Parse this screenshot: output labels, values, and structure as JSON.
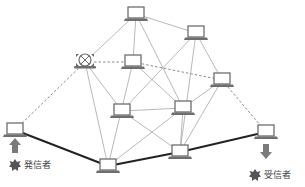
{
  "diagram": {
    "title": "",
    "colors": {
      "thin_line": "#9a9a9a",
      "dashed_line": "#8a8a8a",
      "bold_line": "#222222",
      "laptop_fill": "#6e6e6e",
      "arrow_fill": "#7a7a7a",
      "badge_fill": "#555555"
    },
    "nodes": [
      {
        "id": "n1",
        "x": 136,
        "y": 14,
        "type": "laptop"
      },
      {
        "id": "n2",
        "x": 196,
        "y": 33,
        "type": "laptop"
      },
      {
        "id": "n3",
        "x": 85,
        "y": 62,
        "type": "broken-laptop"
      },
      {
        "id": "n4",
        "x": 133,
        "y": 62,
        "type": "laptop"
      },
      {
        "id": "n5",
        "x": 222,
        "y": 80,
        "type": "laptop"
      },
      {
        "id": "n6",
        "x": 122,
        "y": 111,
        "type": "laptop"
      },
      {
        "id": "n7",
        "x": 183,
        "y": 108,
        "type": "laptop"
      },
      {
        "id": "n8",
        "x": 180,
        "y": 152,
        "type": "laptop"
      },
      {
        "id": "n9",
        "x": 108,
        "y": 166,
        "type": "laptop"
      },
      {
        "id": "sender",
        "x": 15,
        "y": 130,
        "type": "laptop"
      },
      {
        "id": "receiver",
        "x": 266,
        "y": 132,
        "type": "laptop"
      }
    ],
    "edges_thin": [
      [
        "n1",
        "n3"
      ],
      [
        "n1",
        "n2"
      ],
      [
        "n1",
        "n4"
      ],
      [
        "n1",
        "n7"
      ],
      [
        "n2",
        "n6"
      ],
      [
        "n2",
        "n8"
      ],
      [
        "n2",
        "n5"
      ],
      [
        "n3",
        "n6"
      ],
      [
        "n3",
        "n9"
      ],
      [
        "n4",
        "n9"
      ],
      [
        "n4",
        "n7"
      ],
      [
        "n5",
        "n7"
      ],
      [
        "n5",
        "n8"
      ],
      [
        "n6",
        "n7"
      ],
      [
        "n6",
        "n8"
      ],
      [
        "n7",
        "n9"
      ],
      [
        "n7",
        "n8"
      ]
    ],
    "edges_dashed": [
      [
        "n3",
        "n4"
      ],
      [
        "n4",
        "n5"
      ],
      [
        "n3",
        "sender"
      ],
      [
        "n5",
        "receiver"
      ]
    ],
    "edges_bold": [
      [
        "sender",
        "n9"
      ],
      [
        "n9",
        "n8"
      ],
      [
        "n8",
        "receiver"
      ]
    ],
    "sender": {
      "label": "発信者",
      "arrow": "up"
    },
    "receiver": {
      "label": "受信者",
      "arrow": "down"
    }
  }
}
